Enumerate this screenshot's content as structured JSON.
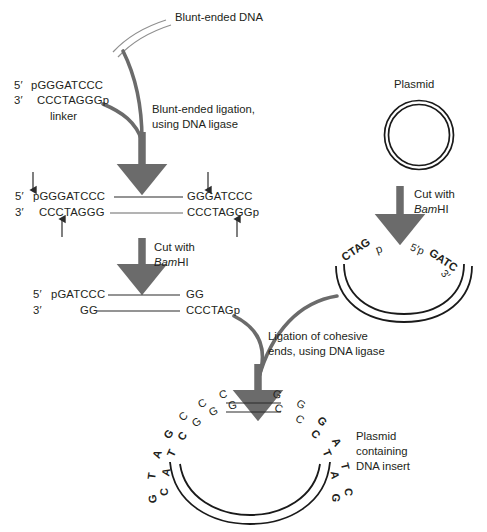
{
  "figure": {
    "colors": {
      "text": "#231f20",
      "arrow_gray": "#6b6b6b",
      "curve_gray": "#6b6b6b",
      "dna_line": "#8a8a8a",
      "plasmid_dark": "#1a1a1a"
    }
  },
  "labels": {
    "blunt_dna": "Blunt-ended DNA",
    "plasmid": "Plasmid",
    "linker_caption": "linker",
    "blunt_ligation_line1": "Blunt-ended ligation,",
    "blunt_ligation_line2": "using DNA ligase",
    "cut_with_line1": "Cut with",
    "cut_bam_italic": "Bam",
    "cut_bam_rest": "HI",
    "cut_plasmid_line1": "Cut with",
    "cut_plasmid_bam_italic": "Bam",
    "cut_plasmid_bam_rest": "HI",
    "ligation_cohesive_line1": "Ligation of cohesive",
    "ligation_cohesive_line2": "ends, using DNA ligase",
    "product_line1": "Plasmid",
    "product_line2": "containing",
    "product_line3": "DNA insert"
  },
  "linker": {
    "five_prime_tag": "5′",
    "five_prime_seq": "pGGGATCCC",
    "three_prime_tag": "3′",
    "three_prime_seq": "CCCTAGGGp"
  },
  "ligated": {
    "five_prime_tag": "5′",
    "left_top": "pGGGATCCC",
    "left_bottom": "CCCTAGGG",
    "three_prime_tag": "3′",
    "right_top": "GGGATCCC",
    "right_bottom": "CCCTAGGGp"
  },
  "cut_product": {
    "five_prime_tag": "5′",
    "left_top": "pGATCCC",
    "left_bottom": "GG",
    "three_prime_tag": "3′",
    "right_top": "GG",
    "right_bottom": "CCCTAGp"
  },
  "open_plasmid": {
    "left_end": "CTAG",
    "left_end_p": "p",
    "right_five_prime": "5′p",
    "right_end": "GATC",
    "right_three_prime": "3′"
  },
  "final_plasmid": {
    "left_arc_top_strand": [
      "G",
      "T",
      "A",
      "G",
      "C",
      "C",
      "C"
    ],
    "left_arc_bottom_strand": [
      "C",
      "A",
      "T",
      "C",
      "G",
      "G",
      "G"
    ],
    "right_arc_top_strand": [
      "G",
      "G",
      "G",
      "A",
      "T",
      "C"
    ],
    "right_arc_bottom_strand": [
      "C",
      "C",
      "C",
      "T",
      "A",
      "G"
    ],
    "bold_bases_left": [
      "C",
      "A",
      "T",
      "G"
    ],
    "bold_bases_right": [
      "G",
      "A",
      "T",
      "C"
    ]
  }
}
